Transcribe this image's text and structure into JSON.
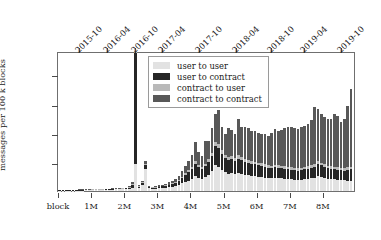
{
  "chart_data": {
    "type": "bar",
    "stacked": true,
    "title": "",
    "xlabel": "",
    "ylabel": "messages per 100 k blocks",
    "ylim": [
      0,
      48
    ],
    "yunit": "M",
    "ytick_values": [
      10,
      20,
      30,
      40
    ],
    "ytick_labels": [
      "10 M",
      "20 M",
      "30 M",
      "40 M"
    ],
    "xlim": [
      0,
      9.0
    ],
    "xtick_values": [
      0,
      1,
      2,
      3,
      4,
      5,
      6,
      7,
      8
    ],
    "xtick_labels": [
      "block",
      "1M",
      "2M",
      "3M",
      "4M",
      "5M",
      "6M",
      "7M",
      "8M"
    ],
    "top_axis": {
      "label": "",
      "tick_positions": [
        0.62,
        1.47,
        2.33,
        3.15,
        4.26,
        5.38,
        6.42,
        7.42,
        8.56
      ],
      "tick_labels": [
        "2015-10",
        "2016-04",
        "2016-10",
        "2017-04",
        "2017-10",
        "2018-04",
        "2018-10",
        "2019-04",
        "2019-10"
      ]
    },
    "grid": false,
    "legend_position": "upper center",
    "series": [
      {
        "name": "user to user",
        "color": "#e2e2e2"
      },
      {
        "name": "user to contract",
        "color": "#262626"
      },
      {
        "name": "contract to user",
        "color": "#b9b9b9"
      },
      {
        "name": "contract to contract",
        "color": "#585858"
      }
    ],
    "x": [
      0.05,
      0.15,
      0.25,
      0.35,
      0.45,
      0.55,
      0.65,
      0.75,
      0.85,
      0.95,
      1.05,
      1.15,
      1.25,
      1.35,
      1.45,
      1.55,
      1.65,
      1.75,
      1.85,
      1.95,
      2.05,
      2.15,
      2.25,
      2.35,
      2.45,
      2.55,
      2.65,
      2.75,
      2.85,
      2.95,
      3.05,
      3.15,
      3.25,
      3.35,
      3.45,
      3.55,
      3.65,
      3.75,
      3.85,
      3.95,
      4.05,
      4.15,
      4.25,
      4.35,
      4.45,
      4.55,
      4.65,
      4.75,
      4.85,
      4.95,
      5.05,
      5.15,
      5.25,
      5.35,
      5.45,
      5.55,
      5.65,
      5.75,
      5.85,
      5.95,
      6.05,
      6.15,
      6.25,
      6.35,
      6.45,
      6.55,
      6.65,
      6.75,
      6.85,
      6.95,
      7.05,
      7.15,
      7.25,
      7.35,
      7.45,
      7.55,
      7.65,
      7.75,
      7.85,
      7.95,
      8.05,
      8.15,
      8.25,
      8.35,
      8.45,
      8.55,
      8.65,
      8.75,
      8.85
    ],
    "values": {
      "user to user": [
        0.05,
        0.06,
        0.07,
        0.08,
        0.1,
        0.12,
        0.14,
        0.16,
        0.2,
        0.25,
        0.3,
        0.32,
        0.35,
        0.38,
        0.42,
        0.46,
        0.5,
        0.55,
        0.58,
        0.62,
        0.7,
        0.8,
        1.2,
        9.2,
        0.9,
        2.2,
        7.6,
        1.0,
        0.8,
        0.8,
        0.9,
        1.0,
        1.1,
        1.25,
        1.45,
        1.7,
        2.1,
        2.6,
        3.2,
        3.6,
        4.1,
        5.2,
        4.6,
        4.2,
        4.8,
        5.6,
        6.8,
        8.8,
        8.4,
        7.2,
        6.4,
        6.0,
        6.2,
        5.8,
        6.3,
        6.0,
        5.6,
        5.4,
        5.2,
        5.1,
        4.9,
        4.7,
        4.6,
        4.4,
        4.3,
        4.5,
        4.4,
        4.3,
        4.2,
        4.1,
        4.0,
        3.9,
        3.8,
        3.9,
        4.0,
        4.1,
        4.3,
        4.6,
        5.0,
        4.8,
        4.5,
        4.2,
        4.1,
        4.0,
        3.9,
        3.8,
        3.7,
        3.6,
        3.5
      ],
      "user to contract": [
        0.01,
        0.01,
        0.01,
        0.01,
        0.01,
        0.02,
        0.02,
        0.02,
        0.03,
        0.03,
        0.04,
        0.04,
        0.05,
        0.05,
        0.06,
        0.06,
        0.07,
        0.08,
        0.08,
        0.09,
        0.2,
        0.4,
        0.9,
        38.0,
        0.6,
        0.7,
        1.2,
        0.4,
        0.35,
        0.4,
        0.5,
        0.6,
        0.7,
        0.8,
        0.95,
        1.1,
        1.4,
        1.8,
        2.3,
        2.8,
        3.3,
        4.0,
        3.5,
        3.2,
        3.7,
        4.4,
        5.2,
        6.5,
        6.2,
        5.4,
        4.9,
        4.6,
        4.7,
        4.4,
        4.8,
        4.6,
        4.3,
        4.2,
        4.1,
        4.0,
        3.9,
        3.8,
        3.7,
        3.6,
        3.5,
        3.6,
        3.55,
        3.5,
        3.45,
        3.4,
        3.3,
        3.25,
        3.2,
        3.3,
        3.4,
        3.5,
        3.6,
        3.8,
        4.1,
        3.95,
        3.8,
        3.6,
        3.5,
        3.45,
        3.4,
        3.35,
        3.3,
        3.7,
        4.0
      ],
      "contract to user": [
        0.0,
        0.0,
        0.0,
        0.0,
        0.0,
        0.0,
        0.01,
        0.01,
        0.01,
        0.01,
        0.01,
        0.01,
        0.02,
        0.02,
        0.02,
        0.02,
        0.03,
        0.03,
        0.03,
        0.04,
        0.05,
        0.08,
        0.15,
        0.8,
        0.1,
        0.15,
        0.6,
        0.08,
        0.07,
        0.08,
        0.1,
        0.12,
        0.14,
        0.16,
        0.2,
        0.25,
        0.32,
        0.42,
        0.55,
        0.65,
        0.75,
        0.95,
        0.85,
        0.78,
        0.88,
        1.0,
        1.2,
        1.5,
        1.45,
        1.3,
        1.2,
        1.15,
        1.18,
        1.1,
        1.2,
        1.15,
        1.1,
        1.05,
        1.02,
        1.0,
        0.98,
        0.95,
        0.92,
        0.9,
        0.88,
        0.92,
        0.9,
        0.88,
        0.86,
        0.85,
        0.82,
        0.8,
        0.78,
        0.82,
        0.85,
        0.88,
        0.92,
        0.98,
        1.05,
        1.02,
        0.96,
        0.92,
        0.9,
        0.88,
        0.86,
        0.84,
        0.82,
        0.85,
        0.9
      ],
      "contract to contract": [
        0.0,
        0.0,
        0.0,
        0.0,
        0.01,
        0.01,
        0.01,
        0.01,
        0.02,
        0.02,
        0.02,
        0.03,
        0.03,
        0.03,
        0.04,
        0.04,
        0.05,
        0.05,
        0.06,
        0.06,
        0.15,
        0.3,
        0.7,
        0.0,
        0.4,
        0.5,
        0.9,
        0.3,
        0.25,
        0.3,
        0.4,
        0.5,
        0.6,
        0.75,
        0.9,
        1.1,
        1.5,
        2.0,
        2.7,
        3.4,
        4.2,
        6.8,
        4.6,
        4.0,
        7.7,
        6.2,
        8.4,
        9.6,
        11.6,
        8.2,
        7.2,
        9.8,
        9.0,
        8.4,
        12.3,
        10.1,
        10.8,
        11.1,
        10.4,
        10.6,
        10.1,
        10.0,
        10.5,
        9.8,
        11.3,
        12.4,
        11.9,
        12.2,
        13.2,
        13.5,
        14.0,
        13.8,
        13.5,
        13.9,
        14.2,
        14.6,
        15.5,
        19.4,
        17.9,
        16.6,
        16.0,
        15.9,
        16.1,
        18.1,
        17.6,
        15.7,
        16.8,
        21.0,
        26.6
      ]
    }
  }
}
